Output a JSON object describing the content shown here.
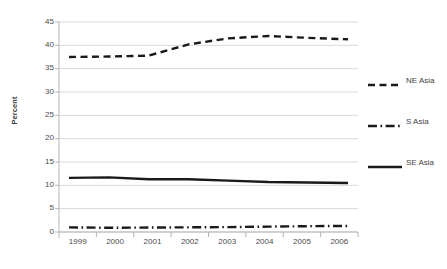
{
  "chart_data": {
    "type": "line",
    "title": "",
    "subtitle": "",
    "xlabel": "",
    "ylabel": "Percent",
    "categories": [
      "1999",
      "2000",
      "2001",
      "2002",
      "2003",
      "2004",
      "2005",
      "2006"
    ],
    "x": [
      1999,
      2000,
      2001,
      2002,
      2003,
      2004,
      2005,
      2006
    ],
    "xlim": [
      1999,
      2006
    ],
    "ylim": [
      0,
      45
    ],
    "ytick_values": [
      0,
      5,
      10,
      15,
      20,
      25,
      30,
      35,
      40,
      45
    ],
    "ytick_labels": [
      "0",
      "5",
      "10",
      "15",
      "20",
      "25",
      "30",
      "35",
      "40",
      "45"
    ],
    "grid": "horizontal",
    "legend_position": "right",
    "series": [
      {
        "name": "NE Asia",
        "values": [
          37.5,
          37.6,
          37.8,
          40.2,
          41.5,
          42.0,
          41.6,
          41.3
        ],
        "style": "dashed",
        "color": "#1a1a1a"
      },
      {
        "name": "S Asia",
        "values": [
          1.0,
          0.9,
          0.95,
          1.0,
          1.05,
          1.15,
          1.25,
          1.3
        ],
        "style": "dash-dot",
        "color": "#1a1a1a"
      },
      {
        "name": "SE Asia",
        "values": [
          11.6,
          11.7,
          11.3,
          11.3,
          11.0,
          10.7,
          10.6,
          10.5
        ],
        "style": "solid",
        "color": "#1a1a1a"
      }
    ]
  },
  "axis": {
    "y_label": "Percent",
    "y_ticks": [
      "45",
      "40",
      "35",
      "30",
      "25",
      "20",
      "15",
      "10",
      "5",
      "0"
    ],
    "x_ticks": [
      "1999",
      "2000",
      "2001",
      "2002",
      "2003",
      "2004",
      "2005",
      "2006"
    ]
  },
  "legend": {
    "items": [
      {
        "label": "NE Asia",
        "style": "dashed"
      },
      {
        "label": "S Asia",
        "style": "dash-dot"
      },
      {
        "label": "SE Asia",
        "style": "solid"
      }
    ]
  },
  "colors": {
    "series_line": "#1a1a1a",
    "gridline": "#d9d9d9",
    "axis_line": "#b5b5b5",
    "tick_text": "#4a4a4a",
    "background": "#ffffff"
  }
}
